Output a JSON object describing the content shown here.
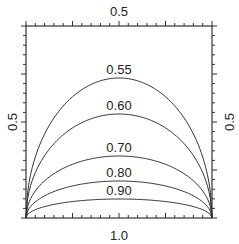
{
  "chart_data": {
    "type": "line",
    "title": "",
    "xlabel": "",
    "ylabel": "",
    "axes": {
      "top_label": "0.5",
      "bottom_label": "1.0",
      "left_label": "0.5",
      "right_label": "0.5"
    },
    "frame": {
      "left": 26,
      "right": 212,
      "top": 26,
      "bottom": 218
    },
    "grid": false,
    "legend": "none",
    "series": [
      {
        "name": "0.55",
        "label": "0.55",
        "peak_y_px": 78
      },
      {
        "name": "0.60",
        "label": "0.60",
        "peak_y_px": 114
      },
      {
        "name": "0.70",
        "label": "0.70",
        "peak_y_px": 156
      },
      {
        "name": "0.80",
        "label": "0.80",
        "peak_y_px": 181
      },
      {
        "name": "0.90",
        "label": "0.90",
        "peak_y_px": 199
      }
    ],
    "colors": {
      "line": "#333333",
      "frame": "#333333",
      "background": "#ffffff"
    }
  }
}
